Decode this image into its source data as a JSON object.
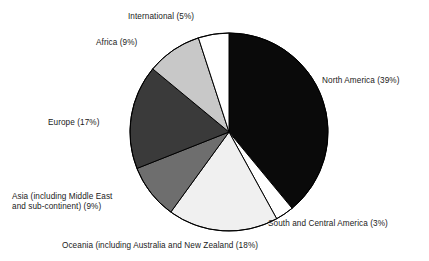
{
  "chart_data": {
    "type": "pie",
    "title": "",
    "subtitle": "",
    "xlabel": "",
    "ylabel": "",
    "legend_position": "none",
    "grid": false,
    "start_angle_deg": 0,
    "direction": "clockwise",
    "categories": [
      "North America",
      "South and Central America",
      "Oceania (including Australia and New Zealand",
      "Asia (including Middle East and sub-continent)",
      "Europe",
      "Africa",
      "International"
    ],
    "values": [
      39,
      3,
      18,
      9,
      17,
      9,
      5
    ],
    "unit": "%",
    "colors": [
      "#0a0a0a",
      "#ffffff",
      "#f0f0f0",
      "#6e6e6e",
      "#3a3a3a",
      "#c8c8c8",
      "#ffffff"
    ],
    "slices": [
      {
        "name": "north-america",
        "label": "North America (39%)",
        "value": 39,
        "color": "#0a0a0a",
        "start_deg": 0,
        "end_deg": 140.4
      },
      {
        "name": "south-and-central-america",
        "label": "South and Central America (3%)",
        "value": 3,
        "color": "#ffffff",
        "start_deg": 140.4,
        "end_deg": 151.2
      },
      {
        "name": "oceania",
        "label": "Oceania (including Australia and New Zealand (18%)",
        "value": 18,
        "color": "#f0f0f0",
        "start_deg": 151.2,
        "end_deg": 216.0
      },
      {
        "name": "asia",
        "label_line1": "Asia (including Middle East",
        "label_line2": "and sub-continent) (9%)",
        "value": 9,
        "color": "#6e6e6e",
        "start_deg": 216.0,
        "end_deg": 248.4
      },
      {
        "name": "europe",
        "label": "Europe (17%)",
        "value": 17,
        "color": "#3a3a3a",
        "start_deg": 248.4,
        "end_deg": 309.6
      },
      {
        "name": "africa",
        "label": "Africa (9%)",
        "value": 9,
        "color": "#c8c8c8",
        "start_deg": 309.6,
        "end_deg": 342.0
      },
      {
        "name": "international",
        "label": "International (5%)",
        "value": 5,
        "color": "#ffffff",
        "start_deg": 342.0,
        "end_deg": 360.0
      }
    ],
    "geometry": {
      "center_x": 229,
      "center_y": 132,
      "radius": 99,
      "outline_color": "#000000"
    }
  }
}
